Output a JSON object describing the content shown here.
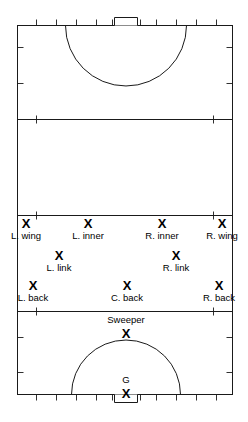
{
  "diagram": {
    "type": "field-hockey-formation",
    "stroke_color": "#1a1a1a",
    "text_color": "#000000",
    "background_color": "#ffffff",
    "player_marker": "X"
  },
  "field": {
    "outline": {
      "left": 17,
      "top": 25,
      "right": 233,
      "bottom": 395
    },
    "lines": [
      {
        "name": "quarter-line-top",
        "y": 119
      },
      {
        "name": "center-line",
        "y": 215
      },
      {
        "name": "quarter-line-bottom",
        "y": 311
      }
    ],
    "circles": [
      {
        "name": "shooting-circle-top",
        "cx": 126,
        "cy": 25,
        "r": 61
      },
      {
        "name": "shooting-circle-bottom",
        "cx": 126,
        "cy": 395,
        "r": 55
      }
    ],
    "goals": [
      {
        "name": "goal-top",
        "cx": 126,
        "width": 24,
        "depth": 8
      },
      {
        "name": "goal-bottom",
        "cx": 126,
        "width": 24,
        "depth": 8
      }
    ],
    "tick_marks": {
      "top_count": 11,
      "bottom_count": 11,
      "side_count": 3
    }
  },
  "players": [
    {
      "id": "l-wing",
      "label": "L. wing",
      "mark": "X",
      "x": 26,
      "y": 217,
      "label_position": "below"
    },
    {
      "id": "l-inner",
      "label": "L. inner",
      "mark": "X",
      "x": 88,
      "y": 217,
      "label_position": "below"
    },
    {
      "id": "r-inner",
      "label": "R. inner",
      "mark": "X",
      "x": 162,
      "y": 217,
      "label_position": "below"
    },
    {
      "id": "r-wing",
      "label": "R. wing",
      "mark": "X",
      "x": 224,
      "y": 217,
      "label_position": "below"
    },
    {
      "id": "l-link",
      "label": "L. link",
      "mark": "X",
      "x": 59,
      "y": 249,
      "label_position": "below"
    },
    {
      "id": "r-link",
      "label": "R. link",
      "mark": "X",
      "x": 176,
      "y": 249,
      "label_position": "below"
    },
    {
      "id": "l-back",
      "label": "L. back",
      "mark": "X",
      "x": 31,
      "y": 279,
      "label_position": "below"
    },
    {
      "id": "c-back",
      "label": "C. back",
      "mark": "X",
      "x": 127,
      "y": 279,
      "label_position": "below"
    },
    {
      "id": "r-back",
      "label": "R. back",
      "mark": "X",
      "x": 221,
      "y": 279,
      "label_position": "below"
    },
    {
      "id": "sweeper",
      "label": "Sweeper",
      "mark": "X",
      "x": 126,
      "y": 315,
      "label_position": "above"
    },
    {
      "id": "goalkeeper",
      "label": "G",
      "mark": "X",
      "x": 126,
      "y": 374,
      "label_position": "above"
    }
  ]
}
